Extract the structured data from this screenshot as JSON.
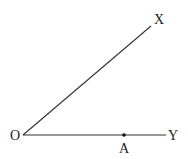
{
  "diagram": {
    "type": "geometry-angle",
    "points": {
      "O": {
        "label": "O",
        "x": 23,
        "y": 135
      },
      "X": {
        "label": "X",
        "x": 151,
        "y": 26
      },
      "Y": {
        "label": "Y",
        "x": 166,
        "y": 135
      },
      "A": {
        "label": "A",
        "x": 124,
        "y": 135
      }
    },
    "rays": [
      {
        "from": "O",
        "to": "X"
      },
      {
        "from": "O",
        "to": "Y"
      }
    ],
    "line_color": "#333333",
    "point_color": "#111111"
  }
}
